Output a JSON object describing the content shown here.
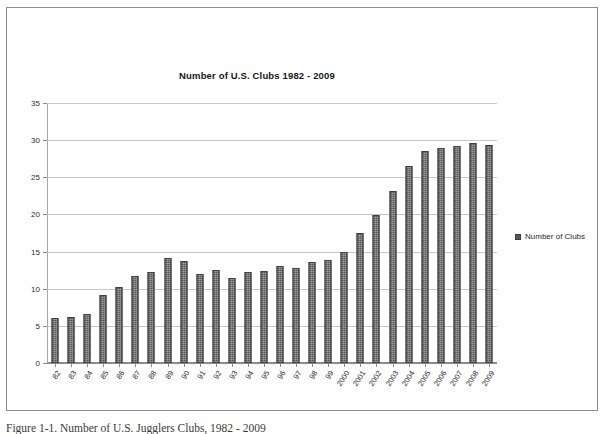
{
  "figure": {
    "caption": "Figure 1-1. Number of U.S. Jugglers Clubs, 1982 - 2009"
  },
  "legend": {
    "position": "right",
    "swatch_color": "#565656",
    "entries": [
      {
        "label": "Number of Clubs"
      }
    ]
  },
  "chart_data": {
    "type": "bar",
    "title": "Number of U.S. Clubs 1982 - 2009",
    "xlabel": "",
    "ylabel": "",
    "ylim": [
      0,
      35
    ],
    "yticks": [
      0,
      5,
      10,
      15,
      20,
      25,
      30,
      35
    ],
    "grid": true,
    "series_name": "Number of Clubs",
    "bar_color": "#565656",
    "categories": [
      "82",
      "83",
      "84",
      "85",
      "86",
      "87",
      "88",
      "89",
      "90",
      "91",
      "92",
      "93",
      "94",
      "95",
      "96",
      "97",
      "98",
      "99",
      "2000",
      "2001",
      "2002",
      "2003",
      "2004",
      "2005",
      "2006",
      "2007",
      "2008",
      "2009"
    ],
    "values": [
      6.1,
      6.2,
      6.6,
      9.1,
      10.2,
      11.7,
      12.2,
      14.1,
      13.7,
      12.0,
      12.5,
      11.5,
      12.3,
      12.4,
      13.1,
      12.8,
      13.6,
      13.9,
      14.9,
      17.5,
      19.9,
      23.1,
      26.5,
      28.6,
      29.0,
      29.2,
      29.6,
      29.3
    ]
  }
}
